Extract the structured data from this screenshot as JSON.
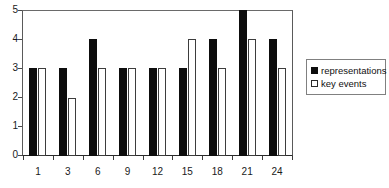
{
  "chart_data": {
    "type": "bar",
    "title": "",
    "subtitle": "",
    "xlabel": "",
    "ylabel": "",
    "categories": [
      "1",
      "3",
      "6",
      "9",
      "12",
      "15",
      "18",
      "21",
      "24"
    ],
    "series": [
      {
        "name": "representations",
        "swatch": "filled-black-square",
        "color": "#0d0d0d",
        "values": [
          3,
          3,
          4,
          3,
          3,
          3,
          4,
          5,
          4
        ]
      },
      {
        "name": "key events",
        "swatch": "hollow-white-square",
        "color": "#ffffff",
        "values": [
          3,
          2,
          3,
          3,
          3,
          4,
          3,
          4,
          3
        ]
      }
    ],
    "ylim": [
      0,
      5
    ],
    "y_ticks": [
      0,
      1,
      2,
      3,
      4,
      5
    ],
    "y_tick_labels": [
      "0",
      "1",
      "2",
      "3",
      "4",
      "5"
    ],
    "grid": false,
    "legend_position": "right",
    "note_group_3_representations": 2
  },
  "legend": {
    "items": [
      {
        "label": "representations"
      },
      {
        "label": "key events"
      }
    ]
  },
  "axes": {
    "y_tick_labels": [
      "5",
      "4",
      "3",
      "2",
      "1",
      "0"
    ],
    "x_tick_labels": [
      "1",
      "3",
      "6",
      "9",
      "12",
      "15",
      "18",
      "21",
      "24"
    ]
  }
}
